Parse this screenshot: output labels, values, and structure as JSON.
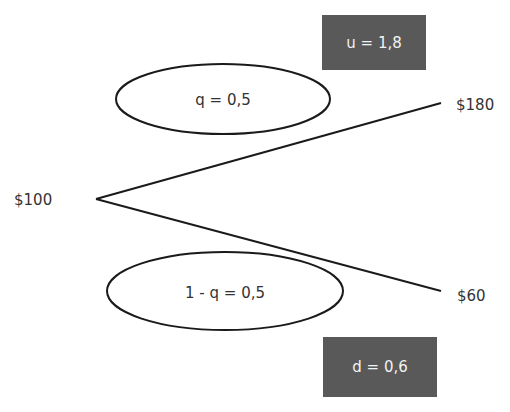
{
  "tree": {
    "root": {
      "label": "$100"
    },
    "up": {
      "label": "$180",
      "probability_label": "q = 0,5",
      "factor_label": "u = 1,8"
    },
    "down": {
      "label": "$60",
      "probability_label": "1 - q = 0,5",
      "factor_label": "d = 0,6"
    }
  },
  "colors": {
    "line": "#1a1a1a",
    "box_fill": "#595959",
    "box_text": "#f2f2f2",
    "text": "#333333"
  }
}
